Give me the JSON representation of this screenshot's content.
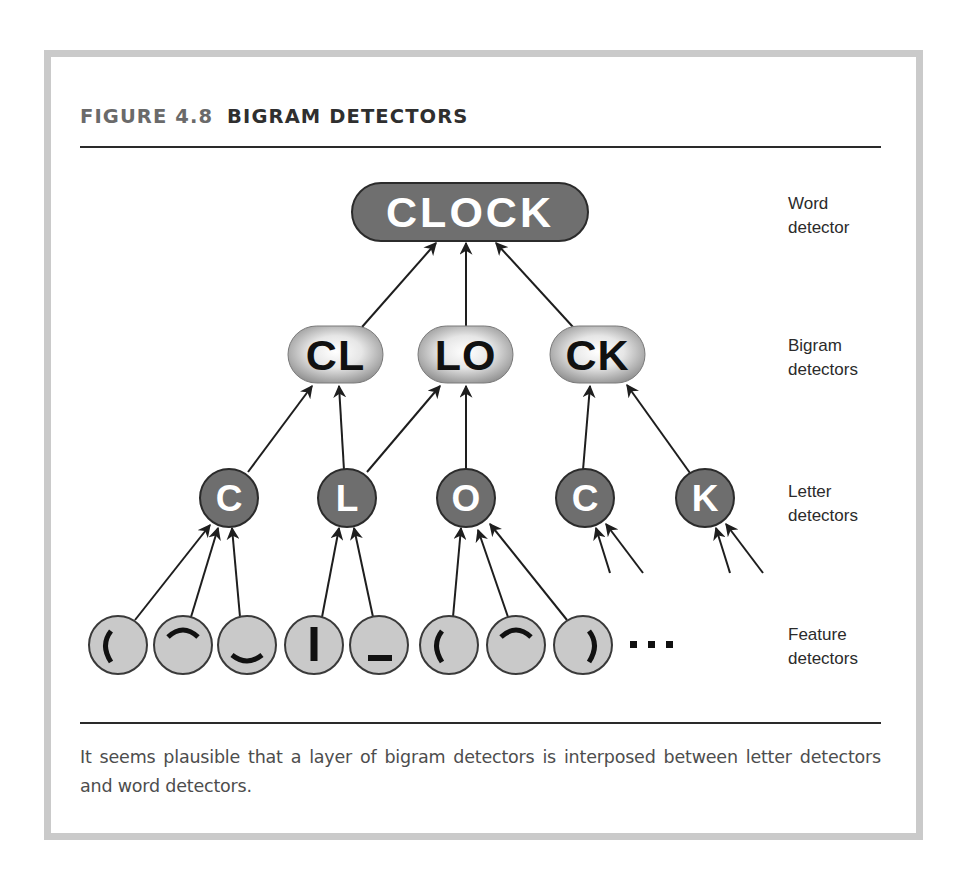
{
  "figure": {
    "number": "FIGURE 4.8",
    "title": "BIGRAM DETECTORS",
    "caption": "It seems plausible that a layer of bigram detectors is interposed between letter detectors and word detectors."
  },
  "colors": {
    "frame_border": "#cacaca",
    "word_fill": "#6f6f6f",
    "letter_fill": "#6e6e6e",
    "feature_fill": "#c9c9c9",
    "outline": "#2b2b2b",
    "bigram_center": "#ffffff",
    "bigram_edge": "#8a8a8a",
    "arrow": "#1e1e1e"
  },
  "levels": [
    {
      "id": "word",
      "label_line1": "Word",
      "label_line2": "detector",
      "top": 192
    },
    {
      "id": "bigram",
      "label_line1": "Bigram",
      "label_line2": "detectors",
      "top": 333
    },
    {
      "id": "letter",
      "label_line1": "Letter",
      "label_line2": "detectors",
      "top": 480
    },
    {
      "id": "feature",
      "label_line1": "Feature",
      "label_line2": "detectors",
      "top": 623
    }
  ],
  "word_detector": {
    "label": "CLOCK",
    "x": 352,
    "y": 183,
    "w": 236,
    "h": 58
  },
  "bigram_detectors": [
    {
      "label": "CL",
      "x": 288,
      "y": 326,
      "w": 95,
      "h": 57
    },
    {
      "label": "LO",
      "x": 418,
      "y": 326,
      "w": 95,
      "h": 57
    },
    {
      "label": "CK",
      "x": 550,
      "y": 326,
      "w": 95,
      "h": 57
    }
  ],
  "letter_detectors": [
    {
      "label": "C",
      "cx": 229,
      "cy": 498,
      "r": 29
    },
    {
      "label": "L",
      "cx": 347,
      "cy": 498,
      "r": 29
    },
    {
      "label": "O",
      "cx": 466,
      "cy": 498,
      "r": 29
    },
    {
      "label": "C",
      "cx": 585,
      "cy": 498,
      "r": 29
    },
    {
      "label": "K",
      "cx": 705,
      "cy": 498,
      "r": 29
    }
  ],
  "feature_detectors": [
    {
      "feature": "left-arc",
      "cx": 118,
      "cy": 645,
      "r": 29
    },
    {
      "feature": "top-arc",
      "cx": 183,
      "cy": 645,
      "r": 29
    },
    {
      "feature": "bottom-arc",
      "cx": 247,
      "cy": 645,
      "r": 29
    },
    {
      "feature": "vertical-bar",
      "cx": 314,
      "cy": 645,
      "r": 29
    },
    {
      "feature": "bottom-bar",
      "cx": 379,
      "cy": 645,
      "r": 29
    },
    {
      "feature": "left-arc",
      "cx": 449,
      "cy": 645,
      "r": 29
    },
    {
      "feature": "top-arc",
      "cx": 516,
      "cy": 645,
      "r": 29
    },
    {
      "feature": "right-arc",
      "cx": 583,
      "cy": 645,
      "r": 29
    }
  ],
  "ellipsis": {
    "text": "...",
    "x": 630,
    "y": 645
  },
  "arrows": [
    {
      "from": [
        362,
        327
      ],
      "to": [
        436,
        243
      ]
    },
    {
      "from": [
        466,
        327
      ],
      "to": [
        466,
        243
      ]
    },
    {
      "from": [
        573,
        327
      ],
      "to": [
        496,
        243
      ]
    },
    {
      "from": [
        248,
        472
      ],
      "to": [
        312,
        386
      ]
    },
    {
      "from": [
        344,
        470
      ],
      "to": [
        339,
        386
      ]
    },
    {
      "from": [
        367,
        472
      ],
      "to": [
        440,
        386
      ]
    },
    {
      "from": [
        466,
        470
      ],
      "to": [
        466,
        386
      ]
    },
    {
      "from": [
        583,
        470
      ],
      "to": [
        590,
        386
      ]
    },
    {
      "from": [
        690,
        473
      ],
      "to": [
        627,
        385
      ]
    },
    {
      "from": [
        135,
        620
      ],
      "to": [
        210,
        525
      ]
    },
    {
      "from": [
        191,
        617
      ],
      "to": [
        218,
        528
      ]
    },
    {
      "from": [
        240,
        617
      ],
      "to": [
        232,
        528
      ]
    },
    {
      "from": [
        322,
        617
      ],
      "to": [
        339,
        528
      ]
    },
    {
      "from": [
        373,
        617
      ],
      "to": [
        354,
        528
      ]
    },
    {
      "from": [
        453,
        617
      ],
      "to": [
        461,
        528
      ]
    },
    {
      "from": [
        508,
        617
      ],
      "to": [
        478,
        530
      ]
    },
    {
      "from": [
        567,
        620
      ],
      "to": [
        490,
        524
      ]
    },
    {
      "from": [
        610,
        573
      ],
      "to": [
        596,
        528
      ]
    },
    {
      "from": [
        643,
        573
      ],
      "to": [
        606,
        524
      ]
    },
    {
      "from": [
        730,
        573
      ],
      "to": [
        716,
        528
      ]
    },
    {
      "from": [
        763,
        573
      ],
      "to": [
        726,
        524
      ]
    }
  ]
}
